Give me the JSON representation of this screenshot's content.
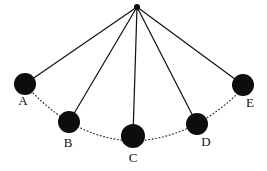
{
  "figure": {
    "background_color": "#ffffff",
    "stroke_color": "#141414",
    "bob_color": "#0d0d0d",
    "arc_color": "#2b2b2b",
    "width": 267,
    "height": 171
  },
  "chart_data": {
    "type": "scatter",
    "xlabel": "",
    "ylabel": "",
    "xlim": [
      0,
      267
    ],
    "ylim": [
      171,
      0
    ],
    "grid": false,
    "legend": null,
    "annotations": [
      "Solid lines are the pendulum string at five instants",
      "Dotted curve is the arc traced by the bob"
    ],
    "pivot": {
      "label": "pivot",
      "x": 137,
      "y": 7,
      "radius": 3
    },
    "categories": [
      "A",
      "B",
      "C",
      "D",
      "E"
    ],
    "points": [
      {
        "label": "A",
        "x": 25,
        "y": 84,
        "radius": 11,
        "label_x": 23,
        "label_y": 105
      },
      {
        "label": "B",
        "x": 69,
        "y": 122,
        "radius": 11,
        "label_x": 68,
        "label_y": 147
      },
      {
        "label": "C",
        "x": 133,
        "y": 136,
        "radius": 12,
        "label_x": 133,
        "label_y": 162
      },
      {
        "label": "D",
        "x": 197,
        "y": 124,
        "radius": 11,
        "label_x": 206,
        "label_y": 146
      },
      {
        "label": "E",
        "x": 243,
        "y": 85,
        "radius": 11,
        "label_x": 250,
        "label_y": 107
      }
    ],
    "strings": [
      {
        "name": "string-to-A",
        "x1": 137,
        "y1": 7,
        "x2": 25,
        "y2": 84
      },
      {
        "name": "string-to-B",
        "x1": 137,
        "y1": 7,
        "x2": 69,
        "y2": 122
      },
      {
        "name": "string-to-C",
        "x1": 137,
        "y1": 7,
        "x2": 133,
        "y2": 136
      },
      {
        "name": "string-to-D",
        "x1": 137,
        "y1": 7,
        "x2": 197,
        "y2": 124
      },
      {
        "name": "string-to-E",
        "x1": 137,
        "y1": 7,
        "x2": 243,
        "y2": 85
      }
    ],
    "arc": {
      "name": "swing-arc",
      "style": "dotted",
      "path": "M 33 93 Q 78 139 133 141 Q 190 139 236 95"
    }
  }
}
